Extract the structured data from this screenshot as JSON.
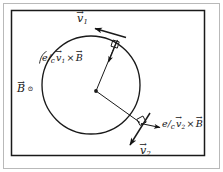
{
  "figure": {
    "background_color": "#ffffff",
    "ink_color": "#141414",
    "outer_border_color": "#b9b9b9",
    "inner_border_color": "#1a1a1a"
  },
  "labels": {
    "velocity_1": {
      "symbol": "v",
      "subscript": "1",
      "arrow": "→"
    },
    "velocity_2": {
      "symbol": "v",
      "subscript": "2",
      "arrow": "→"
    },
    "field": {
      "symbol": "B",
      "arrow": "→",
      "direction_symbol": "⊙"
    },
    "force_1": {
      "coefficient_numerator": "e",
      "coefficient_slash": "/",
      "coefficient_denominator": "c",
      "vector_symbol": "v",
      "vector_subscript": "1",
      "cross": "×",
      "field_symbol": "B",
      "arrow": "→"
    },
    "force_2": {
      "coefficient_numerator": "e",
      "coefficient_slash": "/",
      "coefficient_denominator": "c",
      "vector_symbol": "v",
      "vector_subscript": "2",
      "cross": "×",
      "field_symbol": "B",
      "arrow": "→"
    }
  },
  "geometry": {
    "circle": {
      "cx": 91,
      "cy": 85,
      "r": 49
    },
    "center_point": {
      "x": 96,
      "y": 91
    },
    "tangent_point_1": {
      "x": 113,
      "y": 40
    },
    "tangent_point_2": {
      "x": 139,
      "y": 121
    },
    "velocity_1_arrow": {
      "x1": 122,
      "y1": 35,
      "x2": 93,
      "y2": 27
    },
    "velocity_2_arrow": {
      "x1": 147,
      "y1": 117,
      "x2": 131,
      "y2": 143
    },
    "force_1_arrow": {
      "x1": 117,
      "y1": 42,
      "x2": 107,
      "y2": 66
    },
    "force_2_arrow": {
      "x1": 140,
      "y1": 124,
      "x2": 161,
      "y2": 130
    },
    "leader_line_force_1": {
      "x1": 40,
      "y1": 62,
      "x2": 48,
      "y2": 50
    }
  }
}
